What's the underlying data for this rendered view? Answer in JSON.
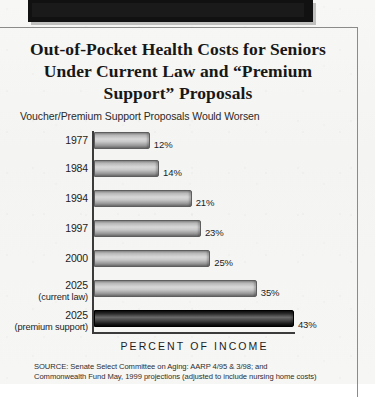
{
  "top_banner": {
    "name": "black-banner-fragment"
  },
  "title": {
    "line1": "Out-of-Pocket Health Costs for Seniors",
    "line2": "Under Current Law and “Premium",
    "line3": "Support” Proposals"
  },
  "subtitle": "Voucher/Premium Support Proposals Would Worsen",
  "axis_caption": "PERCENT OF INCOME",
  "source": {
    "line1": "SOURCE: Senate Select Committee on Aging: AARP 4/95 & 3/98; and",
    "line2": "Commonwealth Fund May, 1999 projections (adjusted to include nursing home costs)"
  },
  "chart_data": {
    "type": "bar",
    "orientation": "horizontal",
    "title": "Out-of-Pocket Health Costs for Seniors Under Current Law and “Premium Support” Proposals",
    "subtitle": "Voucher/Premium Support Proposals Would Worsen",
    "xlabel": "PERCENT OF INCOME",
    "ylabel": "",
    "xlim": [
      0,
      43
    ],
    "grid": false,
    "legend": null,
    "categories": [
      "1977",
      "1984",
      "1994",
      "1997",
      "2000",
      "2025",
      "2025"
    ],
    "category_sublabels": [
      "",
      "",
      "",
      "",
      "",
      "(current law)",
      "(premium support)"
    ],
    "values": [
      12,
      14,
      21,
      23,
      25,
      35,
      43
    ],
    "value_labels": [
      "12%",
      "14%",
      "21%",
      "23%",
      "25%",
      "35%",
      "43%"
    ],
    "highlight_index": 6,
    "colors": {
      "bar_fill_light": "#c9c9c9",
      "bar_fill_dark": "#1c1c1c",
      "axis": "#3b3b3b",
      "text": "#1d1d1d",
      "paper": "#f5f5f3"
    }
  }
}
